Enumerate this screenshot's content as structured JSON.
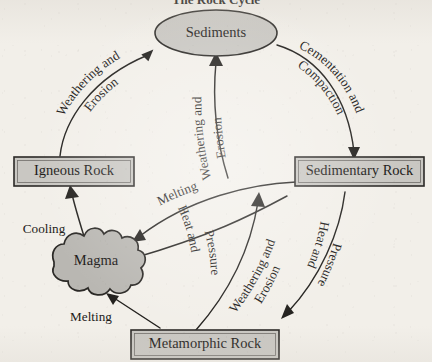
{
  "diagram": {
    "title": "The Rock Cycle",
    "background_color": "#f2efe9",
    "ink_color": "#23211e",
    "node_fill_color": "#c9c7c2",
    "nodes": [
      {
        "id": "sediments",
        "label": "Sediments",
        "shape": "ellipse"
      },
      {
        "id": "igneous_rock",
        "label": "Igneous Rock",
        "shape": "rect"
      },
      {
        "id": "sedimentary_rock",
        "label": "Sedimentary Rock",
        "shape": "rect"
      },
      {
        "id": "metamorphic_rock",
        "label": "Metamorphic Rock",
        "shape": "rect"
      },
      {
        "id": "magma",
        "label": "Magma",
        "shape": "blob"
      }
    ],
    "edges": [
      {
        "id": "igneous_to_sediments",
        "from": "igneous_rock",
        "to": "sediments",
        "label_line1": "Weathering and",
        "label_line2": "Erosion"
      },
      {
        "id": "sediments_to_sedimentary",
        "from": "sediments",
        "to": "sedimentary_rock",
        "label_line1": "Cementation and",
        "label_line2": "Compaction"
      },
      {
        "id": "metamorphic_to_sediments",
        "from": "metamorphic_rock",
        "to": "sediments",
        "label_line1": "Weathering and",
        "label_line2": "Erosion"
      },
      {
        "id": "sedimentary_to_metamorphic",
        "from": "sedimentary_rock",
        "to": "metamorphic_rock",
        "label_line1": "Heat and",
        "label_line2": "Pressure"
      },
      {
        "id": "sedimentary_to_magma",
        "from": "sedimentary_rock",
        "to": "magma",
        "label_line1": "Melting",
        "label_line2": ""
      },
      {
        "id": "sedimentary_to_metamorphic_hp",
        "from": "sedimentary_rock",
        "to": "metamorphic_rock",
        "label_line1": "Heat and Pressure",
        "label_line2": ""
      },
      {
        "id": "metamorphic_to_magma",
        "from": "metamorphic_rock",
        "to": "magma",
        "label_line1": "Melting",
        "label_line2": ""
      },
      {
        "id": "magma_to_igneous",
        "from": "magma",
        "to": "igneous_rock",
        "label_line1": "Cooling",
        "label_line2": ""
      },
      {
        "id": "sedimentary_to_sediments_we",
        "from": "sedimentary_rock",
        "to": "sediments",
        "label_line1": "Weathering and",
        "label_line2": "Erosion"
      }
    ],
    "labels": {
      "weathering_erosion_left_1": "Weathering and",
      "weathering_erosion_left_2": "Erosion",
      "cementation_compaction_1": "Cementation and",
      "cementation_compaction_2": "Compaction",
      "weathering_erosion_center_1": "Weathering and",
      "weathering_erosion_center_2": "Erosion",
      "weathering_erosion_right_1": "Weathering and",
      "weathering_erosion_right_2": "Erosion",
      "melting_upper": "Melting",
      "heat_and_pressure_center_1": "Heat and",
      "heat_and_pressure_center_2": "Pressure",
      "heat_and_pressure_right_1": "Heat and",
      "heat_and_pressure_right_2": "Pressure",
      "cooling": "Cooling",
      "melting_lower": "Melting"
    }
  }
}
